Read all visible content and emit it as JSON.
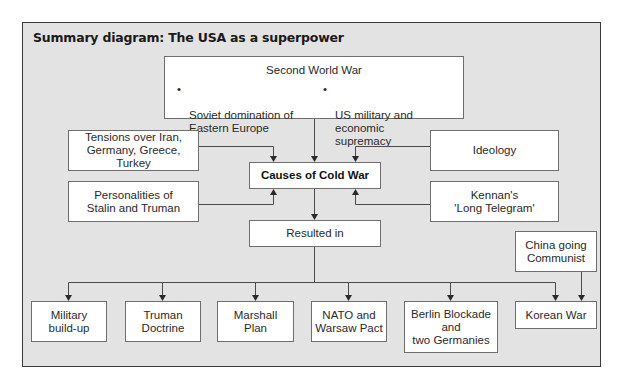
{
  "diagram": {
    "title": "Summary diagram: The USA as a superpower",
    "colors": {
      "background": "#e3e3e3",
      "box_fill": "#ffffff",
      "box_border": "#6e6e6e",
      "line": "#3a3a3a"
    },
    "top": {
      "label": "Second World War",
      "bullets": [
        {
          "marker": "•",
          "text": "Soviet domination of\nEastern Europe"
        },
        {
          "marker": "•",
          "text": "US military and economic\nsupremacy"
        }
      ]
    },
    "left_causes": [
      {
        "label": "Tensions over Iran,\nGermany, Greece, Turkey"
      },
      {
        "label": "Personalities of\nStalin and Truman"
      }
    ],
    "right_causes": [
      {
        "label": "Ideology"
      },
      {
        "label": "Kennan's\n'Long Telegram'"
      }
    ],
    "center": {
      "label": "Causes of Cold War"
    },
    "resulted": {
      "label": "Resulted in"
    },
    "side_cause": {
      "label": "China going\nCommunist"
    },
    "results": [
      {
        "label": "Military\nbuild-up"
      },
      {
        "label": "Truman\nDoctrine"
      },
      {
        "label": "Marshall\nPlan"
      },
      {
        "label": "NATO and\nWarsaw Pact"
      },
      {
        "label": "Berlin Blockade\nand\ntwo Germanies"
      },
      {
        "label": "Korean War"
      }
    ]
  }
}
